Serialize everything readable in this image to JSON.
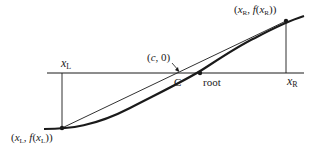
{
  "diagram": {
    "labels": {
      "xL": {
        "base": "x",
        "sub": "L"
      },
      "xR": {
        "base": "x",
        "sub": "R"
      },
      "left_point": "(xL, f(xL))",
      "right_point": "(xR, f(xR))",
      "c_point": "(c, 0)",
      "c_marker": "C",
      "root": "root"
    },
    "colors": {
      "ink": "#1a1a1a",
      "background": "#ffffff"
    }
  }
}
